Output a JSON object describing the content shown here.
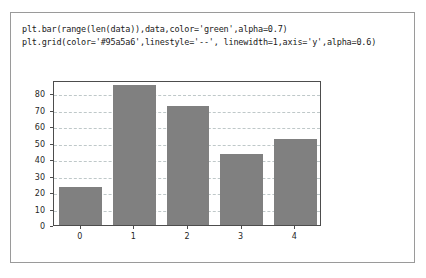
{
  "code": {
    "lines": [
      "plt.bar(range(len(data)),data,color='green',alpha=0.7)",
      "plt.grid(color='#95a5a6',linestyle='--', linewidth=1,axis='y',alpha=0.6)"
    ]
  },
  "colors": {
    "bar_fill": "#808080",
    "grid_line": "#95a5a6",
    "axis_line": "#4d4d4d",
    "panel_border": "#9a9a9a",
    "text": "#1a1a1a"
  },
  "chart_data": {
    "type": "bar",
    "title": "",
    "xlabel": "",
    "ylabel": "",
    "categories": [
      "0",
      "1",
      "2",
      "3",
      "4"
    ],
    "values": [
      23,
      85,
      72,
      43,
      52
    ],
    "ylim": [
      0,
      88
    ],
    "yticks": [
      0,
      10,
      20,
      30,
      40,
      50,
      60,
      70,
      80
    ],
    "ytick_labels": [
      "0",
      "10",
      "20",
      "30",
      "40",
      "50",
      "60",
      "70",
      "80"
    ],
    "xticks": [
      0,
      1,
      2,
      3,
      4
    ],
    "xtick_labels": [
      "0",
      "1",
      "2",
      "3",
      "4"
    ],
    "grid": true,
    "grid_axis": "y",
    "grid_linestyle": "--",
    "grid_linewidth": 1,
    "grid_alpha": 0.6,
    "bar_color": "green",
    "bar_alpha": 0.7,
    "bar_width": 0.8,
    "legend": false
  }
}
